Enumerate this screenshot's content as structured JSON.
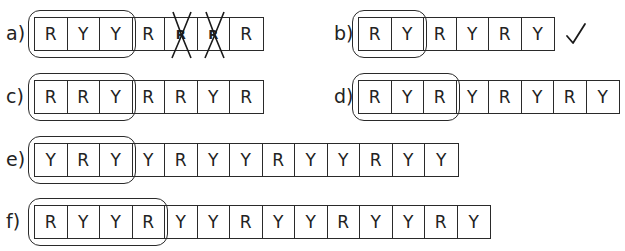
{
  "problems": [
    {
      "id": "a",
      "label": "a)",
      "sequence": [
        "R",
        "Y",
        "Y",
        "R",
        "R",
        "R",
        "R"
      ],
      "unit_length": 3,
      "crossed_cells": [
        4,
        5
      ],
      "mark": ""
    },
    {
      "id": "b",
      "label": "b)",
      "sequence": [
        "R",
        "Y",
        "R",
        "Y",
        "R",
        "Y"
      ],
      "unit_length": 2,
      "crossed_cells": [],
      "mark": "check-icon"
    },
    {
      "id": "c",
      "label": "c)",
      "sequence": [
        "R",
        "R",
        "Y",
        "R",
        "R",
        "Y",
        "R"
      ],
      "unit_length": 3,
      "crossed_cells": [],
      "mark": ""
    },
    {
      "id": "d",
      "label": "d)",
      "sequence": [
        "R",
        "Y",
        "R",
        "Y",
        "R",
        "Y",
        "R",
        "Y"
      ],
      "unit_length": 3,
      "crossed_cells": [],
      "mark": ""
    },
    {
      "id": "e",
      "label": "e)",
      "sequence": [
        "Y",
        "R",
        "Y",
        "Y",
        "R",
        "Y",
        "Y",
        "R",
        "Y",
        "Y",
        "R",
        "Y",
        "Y"
      ],
      "unit_length": 3,
      "crossed_cells": [],
      "mark": ""
    },
    {
      "id": "f",
      "label": "f)",
      "sequence": [
        "R",
        "Y",
        "Y",
        "R",
        "Y",
        "Y",
        "R",
        "Y",
        "Y",
        "R",
        "Y",
        "Y",
        "R",
        "Y"
      ],
      "unit_length": 4,
      "crossed_cells": [],
      "mark": ""
    }
  ],
  "colors": {
    "line": "#2a2a2a",
    "text": "#222222",
    "background": "#ffffff"
  }
}
